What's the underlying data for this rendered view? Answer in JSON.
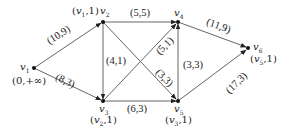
{
  "diagram": {
    "type": "flow-network",
    "nodes": [
      {
        "id": "v1",
        "name": "v",
        "sub": "1",
        "label": "(0,+∞)",
        "x": 34,
        "y": 68
      },
      {
        "id": "v2",
        "name": "v",
        "sub": "2",
        "label": "(v1,1)",
        "x": 103,
        "y": 22
      },
      {
        "id": "v3",
        "name": "v",
        "sub": "3",
        "label": "(v2,1)",
        "x": 103,
        "y": 101
      },
      {
        "id": "v4",
        "name": "v",
        "sub": "4",
        "label": "",
        "x": 178,
        "y": 22
      },
      {
        "id": "v5",
        "name": "v",
        "sub": "5",
        "label": "(v3,1)",
        "x": 178,
        "y": 101
      },
      {
        "id": "v6",
        "name": "v",
        "sub": "6",
        "label": "(v5,1)",
        "x": 248,
        "y": 48
      }
    ],
    "edges": [
      {
        "from": "v1",
        "to": "v2",
        "label": "(10,9)"
      },
      {
        "from": "v1",
        "to": "v3",
        "label": "(8,3)"
      },
      {
        "from": "v2",
        "to": "v4",
        "label": "(5,5)"
      },
      {
        "from": "v2",
        "to": "v3",
        "label": "(4,1)"
      },
      {
        "from": "v2",
        "to": "v5",
        "label": "(3,3)"
      },
      {
        "from": "v3",
        "to": "v4",
        "label": "(5,1)"
      },
      {
        "from": "v3",
        "to": "v5",
        "label": "(6,3)"
      },
      {
        "from": "v5",
        "to": "v4",
        "label": "(3,3)"
      },
      {
        "from": "v4",
        "to": "v6",
        "label": "(11,9)"
      },
      {
        "from": "v5",
        "to": "v6",
        "label": "(17,3)"
      }
    ]
  },
  "labels": {
    "v1_name": "v",
    "v1_sub": "1",
    "v1_mark": "(0,+∞)",
    "v2_name": "v",
    "v2_sub": "2",
    "v2_mark_pre": "(",
    "v2_mark_v": "v",
    "v2_mark_sub": "1",
    "v2_mark_post": ",1)",
    "v3_name": "v",
    "v3_sub": "3",
    "v3_mark_pre": "(",
    "v3_mark_v": "v",
    "v3_mark_sub": "2",
    "v3_mark_post": ",1)",
    "v4_name": "v",
    "v4_sub": "4",
    "v5_name": "v",
    "v5_sub": "5",
    "v5_mark_pre": "(",
    "v5_mark_v": "v",
    "v5_mark_sub": "3",
    "v5_mark_post": ",1)",
    "v6_name": "v",
    "v6_sub": "6",
    "v6_mark_pre": "(",
    "v6_mark_v": "v",
    "v6_mark_sub": "5",
    "v6_mark_post": ",1)",
    "e12": "(10,9)",
    "e13": "(8,3)",
    "e24": "(5,5)",
    "e23": "(4,1)",
    "e25": "(3,3)",
    "e34": "(5,1)",
    "e35": "(6,3)",
    "e54": "(3,3)",
    "e46": "(11,9)",
    "e56": "(17,3)"
  },
  "colors": {
    "line": "#555555",
    "node": "#111111",
    "text": "#222222",
    "background": "#ffffff"
  }
}
